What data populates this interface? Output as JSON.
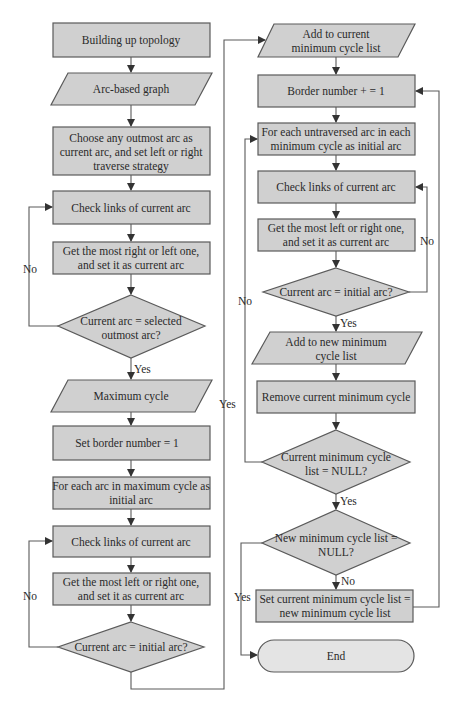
{
  "diagram": {
    "type": "flowchart",
    "left_column": {
      "n1": [
        "Building up topology"
      ],
      "n2": [
        "Arc-based graph"
      ],
      "n3": [
        "Choose any outmost arc as",
        "current arc, and set left or right",
        "traverse strategy"
      ],
      "n4": [
        "Check links of current arc"
      ],
      "n5": [
        "Get the most right or left one,",
        "and set it as current arc"
      ],
      "n6": [
        "Current arc = selected",
        "outmost arc?"
      ],
      "n7": [
        "Maximum cycle"
      ],
      "n8": [
        "Set border number = 1"
      ],
      "n9": [
        "For each arc in maximum cycle as",
        "initial arc"
      ],
      "n10": [
        "Check links of current arc"
      ],
      "n11": [
        "Get the most left or right one,",
        "and set it as current arc"
      ],
      "n12": [
        "Current arc = initial arc?"
      ]
    },
    "right_column": {
      "n13": [
        "Add to current",
        "minimum cycle list"
      ],
      "n14": [
        "Border number + = 1"
      ],
      "n15": [
        "For each untraversed arc in each",
        "minimum cycle as initial arc"
      ],
      "n16": [
        "Check links of current arc"
      ],
      "n17": [
        "Get the most left or right one,",
        "and set it as current arc"
      ],
      "n18": [
        "Current arc = initial arc?"
      ],
      "n19": [
        "Add to new minimum",
        "cycle list"
      ],
      "n20": [
        "Remove current minimum cycle"
      ],
      "n21": [
        "Current minimum cycle",
        "list = NULL?"
      ],
      "n22": [
        "New minimum cycle list =",
        "NULL?"
      ],
      "n23": [
        "Set current minimum cycle list =",
        "new minimum cycle list"
      ],
      "n24": [
        "End"
      ]
    },
    "edge_labels": {
      "n6_no": "No",
      "n6_yes": "Yes",
      "n12_no": "No",
      "n12_yes": "Yes",
      "n18_no": "No",
      "n18_yes": "Yes",
      "n21_no": "No",
      "n21_yes": "Yes",
      "n22_no": "No",
      "n22_yes": "Yes"
    },
    "colors": {
      "node_fill": "#d0d0d0",
      "terminal_fill": "#e4e4e4",
      "stroke": "#5a5a5a",
      "text": "#2a2a2a"
    }
  }
}
